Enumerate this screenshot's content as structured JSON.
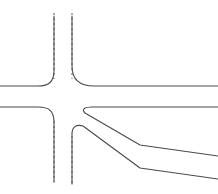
{
  "diagram": {
    "canvas": {
      "width": 218,
      "height": 194,
      "background": "#ffffff"
    },
    "colors": {
      "road_edge": "#4a4a4a",
      "lane_divider": "#6b6b6b",
      "background": "#ffffff"
    },
    "stroke_width": 1.1,
    "dash_pattern": "2 3",
    "elements": {
      "vertical_road": {
        "label": "vertical road",
        "left_edge_x": 54,
        "right_edge_x": 72,
        "dashed": true
      },
      "horizontal_road": {
        "label": "horizontal road",
        "top_edge_y": 86,
        "bottom_edge_y": 107
      },
      "ramp": {
        "label": "diagonal off-ramp",
        "upper_bend": {
          "x": 140,
          "y": 145
        },
        "lower_bend": {
          "x": 140,
          "y": 168
        },
        "upper_exit_y": 156,
        "lower_exit_y": 179
      }
    },
    "paths": {
      "dash_vertical_left_top": "M 54 13 L 54 79",
      "dash_vertical_right_top": "M 72 13 L 72 79",
      "dash_vertical_left_bottom": "M 54 121 L 54 182",
      "dash_vertical_right_bottom": "M 72 136 L 72 184",
      "edge_top_left_corner": "M 0 86 L 38 86 C 50 86 54 81 54 70 L 54 13",
      "edge_top_right_corner": "M 72 13 L 72 68 C 72 80 78 86 92 86 L 218 86",
      "edge_bottom_left_corner": "M 0 107 L 38 107 C 50 107 54 112 54 122 L 54 182",
      "edge_ramp_upper": "M 218 107 L 93 107 C 85 107 82 109 86 113 L 140 145 L 218 156",
      "edge_ramp_lower": "M 72 184 L 72 135 C 72 128 75 125 82 125 L 140 168 L 218 179"
    }
  }
}
